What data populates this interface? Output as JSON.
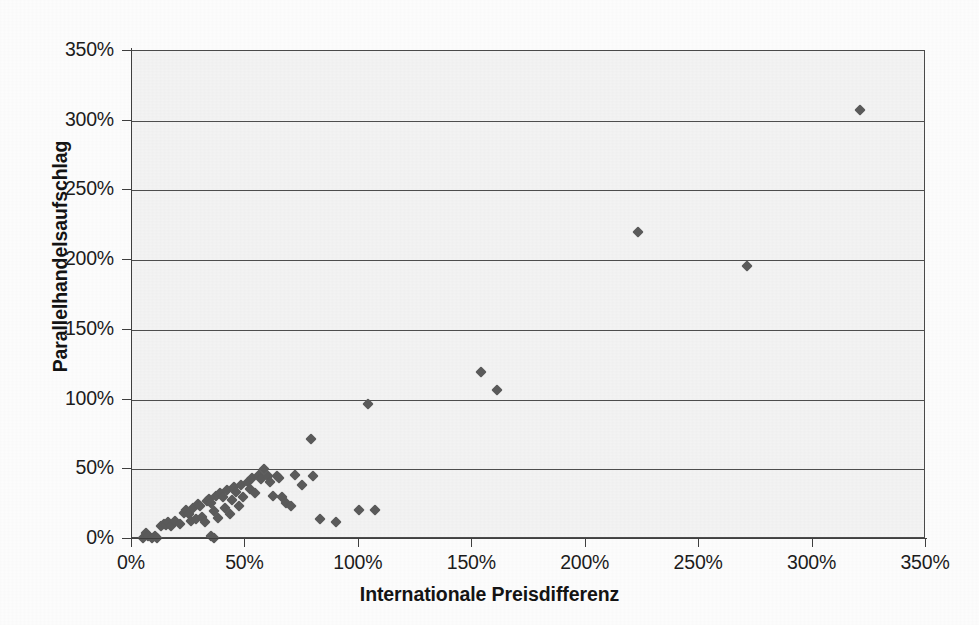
{
  "chart_data": {
    "type": "scatter",
    "title": "",
    "xlabel": "Internationale Preisdifferenz",
    "ylabel": "Parallelhandelsaufschlag",
    "xlim": [
      0,
      350
    ],
    "ylim": [
      0,
      350
    ],
    "xticks": [
      "0%",
      "50%",
      "100%",
      "150%",
      "200%",
      "250%",
      "300%",
      "350%"
    ],
    "yticks": [
      "0%",
      "50%",
      "100%",
      "150%",
      "200%",
      "250%",
      "300%",
      "350%"
    ],
    "xtick_values": [
      0,
      50,
      100,
      150,
      200,
      250,
      300,
      350
    ],
    "ytick_values": [
      0,
      50,
      100,
      150,
      200,
      250,
      300,
      350
    ],
    "grid": "horizontal",
    "legend": "none",
    "unit": "percent",
    "marker": "diamond",
    "marker_color": "#5a5a5a",
    "series": [
      {
        "name": "Parallelhandelsaufschlag vs. Internationale Preisdifferenz",
        "points": [
          [
            5,
            1
          ],
          [
            6,
            4
          ],
          [
            7,
            2
          ],
          [
            9,
            1
          ],
          [
            10,
            2
          ],
          [
            11,
            1
          ],
          [
            13,
            9
          ],
          [
            14,
            11
          ],
          [
            15,
            10
          ],
          [
            16,
            12
          ],
          [
            17,
            9
          ],
          [
            19,
            13
          ],
          [
            21,
            11
          ],
          [
            23,
            19
          ],
          [
            24,
            21
          ],
          [
            25,
            18
          ],
          [
            26,
            13
          ],
          [
            27,
            22
          ],
          [
            28,
            14
          ],
          [
            29,
            25
          ],
          [
            30,
            24
          ],
          [
            31,
            16
          ],
          [
            32,
            12
          ],
          [
            33,
            27
          ],
          [
            34,
            29
          ],
          [
            35,
            26
          ],
          [
            35,
            2
          ],
          [
            36,
            1
          ],
          [
            36,
            20
          ],
          [
            37,
            31
          ],
          [
            38,
            15
          ],
          [
            39,
            33
          ],
          [
            40,
            30
          ],
          [
            41,
            22
          ],
          [
            42,
            35
          ],
          [
            43,
            18
          ],
          [
            44,
            28
          ],
          [
            45,
            37
          ],
          [
            46,
            34
          ],
          [
            47,
            24
          ],
          [
            48,
            39
          ],
          [
            49,
            30
          ],
          [
            51,
            41
          ],
          [
            52,
            36
          ],
          [
            53,
            44
          ],
          [
            54,
            33
          ],
          [
            56,
            46
          ],
          [
            57,
            43
          ],
          [
            58,
            50
          ],
          [
            60,
            45
          ],
          [
            61,
            41
          ],
          [
            62,
            31
          ],
          [
            64,
            45
          ],
          [
            65,
            44
          ],
          [
            66,
            30
          ],
          [
            68,
            26
          ],
          [
            70,
            24
          ],
          [
            72,
            46
          ],
          [
            75,
            39
          ],
          [
            79,
            72
          ],
          [
            80,
            45
          ],
          [
            83,
            14
          ],
          [
            90,
            12
          ],
          [
            100,
            21
          ],
          [
            104,
            97
          ],
          [
            107,
            21
          ],
          [
            154,
            120
          ],
          [
            161,
            107
          ],
          [
            223,
            220
          ],
          [
            271,
            196
          ],
          [
            321,
            308
          ]
        ]
      }
    ]
  }
}
